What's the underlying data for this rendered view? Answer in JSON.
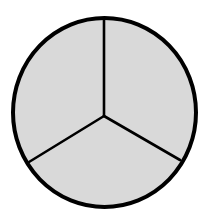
{
  "diagram": {
    "type": "circle-divided-into-equal-parts",
    "parts": 3,
    "shaded_parts": 3,
    "colors": {
      "fill": "#d9d9d9",
      "stroke": "#000000",
      "background": "#ffffff"
    },
    "geometry": {
      "center": [
        104.5,
        112.5
      ],
      "rx": 91.5,
      "ry": 94.5,
      "hub": [
        104,
        116
      ],
      "spoke_ends": [
        [
          104,
          18
        ],
        [
          29,
          162
        ],
        [
          180,
          160
        ]
      ],
      "outline_width": 4,
      "spoke_width": 2.6
    }
  }
}
